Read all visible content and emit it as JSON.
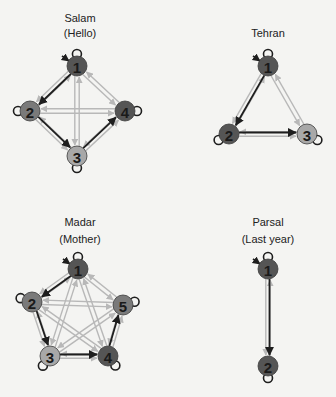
{
  "colors": {
    "background": "#f4f4f2",
    "dark_edge": "#1e1e1e",
    "light_edge": "#b8b8b8",
    "node_dark": "#555555",
    "node_mid": "#7a7a7a",
    "node_light": "#a8a8a8",
    "text": "#222222"
  },
  "diagrams": [
    {
      "id": "salam",
      "title": "Salam",
      "subtitle": "(Hello)",
      "title_pos": [
        80,
        22
      ],
      "subtitle_pos": [
        80,
        37
      ],
      "nodes": [
        {
          "label": "1",
          "x": 77,
          "y": 66,
          "shade": "dark"
        },
        {
          "label": "2",
          "x": 30,
          "y": 111,
          "shade": "mid"
        },
        {
          "label": "3",
          "x": 77,
          "y": 156,
          "shade": "light"
        },
        {
          "label": "4",
          "x": 125,
          "y": 111,
          "shade": "dark"
        }
      ],
      "dark_edges": [
        [
          1,
          2
        ],
        [
          2,
          3
        ],
        [
          3,
          4
        ]
      ],
      "light_edges": [
        [
          1,
          3
        ],
        [
          1,
          4
        ],
        [
          2,
          4
        ],
        [
          1,
          2
        ],
        [
          2,
          3
        ],
        [
          3,
          4
        ]
      ]
    },
    {
      "id": "tehran",
      "title": "Tehran",
      "subtitle": "",
      "title_pos": [
        268,
        37
      ],
      "subtitle_pos": [
        268,
        37
      ],
      "nodes": [
        {
          "label": "1",
          "x": 268,
          "y": 66,
          "shade": "dark"
        },
        {
          "label": "2",
          "x": 229,
          "y": 134,
          "shade": "dark"
        },
        {
          "label": "3",
          "x": 307,
          "y": 134,
          "shade": "light"
        }
      ],
      "dark_edges": [
        [
          1,
          2
        ],
        [
          2,
          3
        ]
      ],
      "light_edges": [
        [
          1,
          3
        ],
        [
          1,
          2
        ],
        [
          2,
          3
        ]
      ]
    },
    {
      "id": "madar",
      "title": "Madar",
      "subtitle": "(Mother)",
      "title_pos": [
        80,
        226
      ],
      "subtitle_pos": [
        80,
        243
      ],
      "nodes": [
        {
          "label": "1",
          "x": 78,
          "y": 269,
          "shade": "dark"
        },
        {
          "label": "2",
          "x": 32,
          "y": 302,
          "shade": "mid"
        },
        {
          "label": "3",
          "x": 50,
          "y": 356,
          "shade": "light"
        },
        {
          "label": "4",
          "x": 108,
          "y": 356,
          "shade": "dark"
        },
        {
          "label": "5",
          "x": 123,
          "y": 305,
          "shade": "mid"
        }
      ],
      "dark_edges": [
        [
          1,
          2
        ],
        [
          2,
          3
        ],
        [
          3,
          4
        ],
        [
          4,
          5
        ]
      ],
      "light_edges": [
        [
          1,
          3
        ],
        [
          1,
          4
        ],
        [
          1,
          5
        ],
        [
          2,
          4
        ],
        [
          2,
          5
        ],
        [
          3,
          5
        ],
        [
          1,
          2
        ],
        [
          2,
          3
        ],
        [
          3,
          4
        ],
        [
          4,
          5
        ]
      ]
    },
    {
      "id": "parsal",
      "title": "Parsal",
      "subtitle": "(Last year)",
      "title_pos": [
        268,
        226
      ],
      "subtitle_pos": [
        268,
        243
      ],
      "nodes": [
        {
          "label": "1",
          "x": 268,
          "y": 269,
          "shade": "dark"
        },
        {
          "label": "2",
          "x": 268,
          "y": 366,
          "shade": "dark"
        }
      ],
      "dark_edges": [
        [
          1,
          2
        ]
      ],
      "light_edges": [
        [
          1,
          2
        ]
      ]
    }
  ]
}
